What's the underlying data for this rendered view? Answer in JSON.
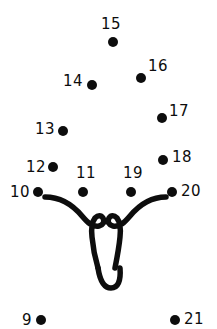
{
  "page": {
    "kind": "connect-the-dots-puzzle",
    "background_color": "#ffffff",
    "ink_color": "#0d0d0d",
    "width": 217,
    "height": 329
  },
  "figure": {
    "name": "elephant-head-outline",
    "stroke_color": "#0d0d0d",
    "stroke_width": 5.5
  },
  "dots": [
    {
      "number": "9",
      "label": "9",
      "cx": 41,
      "cy": 320,
      "r": 5.0,
      "label_x": 22,
      "label_y": 313,
      "label_align": "left"
    },
    {
      "number": "10",
      "label": "10",
      "cx": 38,
      "cy": 192,
      "r": 5.0,
      "label_x": 10,
      "label_y": 185,
      "label_align": "left"
    },
    {
      "number": "11",
      "label": "11",
      "cx": 83,
      "cy": 192,
      "r": 5.0,
      "label_x": 76,
      "label_y": 166,
      "label_align": "left"
    },
    {
      "number": "12",
      "label": "12",
      "cx": 53,
      "cy": 167,
      "r": 5.0,
      "label_x": 26,
      "label_y": 160,
      "label_align": "left"
    },
    {
      "number": "13",
      "label": "13",
      "cx": 63,
      "cy": 131,
      "r": 5.0,
      "label_x": 35,
      "label_y": 122,
      "label_align": "left"
    },
    {
      "number": "14",
      "label": "14",
      "cx": 92,
      "cy": 85,
      "r": 5.0,
      "label_x": 63,
      "label_y": 74,
      "label_align": "left"
    },
    {
      "number": "15",
      "label": "15",
      "cx": 113,
      "cy": 42,
      "r": 5.0,
      "label_x": 101,
      "label_y": 17,
      "label_align": "left"
    },
    {
      "number": "16",
      "label": "16",
      "cx": 141,
      "cy": 78,
      "r": 5.0,
      "label_x": 148,
      "label_y": 59,
      "label_align": "left"
    },
    {
      "number": "17",
      "label": "17",
      "cx": 162,
      "cy": 118,
      "r": 5.0,
      "label_x": 169,
      "label_y": 104,
      "label_align": "left"
    },
    {
      "number": "18",
      "label": "18",
      "cx": 163,
      "cy": 160,
      "r": 5.0,
      "label_x": 172,
      "label_y": 150,
      "label_align": "left"
    },
    {
      "number": "19",
      "label": "19",
      "cx": 131,
      "cy": 192,
      "r": 5.0,
      "label_x": 123,
      "label_y": 166,
      "label_align": "left"
    },
    {
      "number": "20",
      "label": "20",
      "cx": 172,
      "cy": 192,
      "r": 5.0,
      "label_x": 181,
      "label_y": 184,
      "label_align": "left"
    },
    {
      "number": "21",
      "label": "21",
      "cx": 175,
      "cy": 320,
      "r": 5.0,
      "label_x": 184,
      "label_y": 312,
      "label_align": "left"
    }
  ],
  "strokes": [
    {
      "name": "left-brow-and-ear",
      "path": "M 45 197 C 60 197 72 204 82 216 C 88 223 92 227 99 226 C 103 225 105 222 103 218 C 101 215 98 215 95 218 C 92 222 91 228 92 237 C 93 248 95 258 98 268"
    },
    {
      "name": "right-brow-and-ear",
      "path": "M 166 197 C 152 197 140 204 130 216 C 124 223 120 227 113 226 C 109 225 107 222 109 218 C 111 215 114 215 117 218 C 120 222 121 228 120 237 C 119 248 117 258 115 268"
    },
    {
      "name": "trunk-bottom-u",
      "path": "M 98 268 C 100 281 104 288 111 288 C 118 288 121 281 120 268"
    }
  ]
}
